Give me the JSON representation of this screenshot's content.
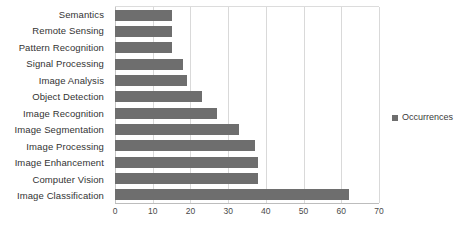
{
  "chart_data": {
    "type": "bar",
    "orientation": "horizontal",
    "title": "",
    "xlabel": "",
    "ylabel": "",
    "xlim": [
      0,
      70
    ],
    "xticks": [
      0,
      10,
      20,
      30,
      40,
      50,
      60,
      70
    ],
    "grid": true,
    "legend_position": "right",
    "categories": [
      "Semantics",
      "Remote Sensing",
      "Pattern Recognition",
      "Signal Processing",
      "Image Analysis",
      "Object Detection",
      "Image Recognition",
      "Image Segmentation",
      "Image Processing",
      "Image Enhancement",
      "Computer Vision",
      "Image Classification"
    ],
    "series": [
      {
        "name": "Occurrences",
        "color": "#6e6e6e",
        "values": [
          15,
          15,
          15,
          18,
          19,
          23,
          27,
          33,
          37,
          38,
          38,
          62
        ]
      }
    ]
  },
  "legend": {
    "entries": [
      {
        "label": "Occurrences",
        "marker": "square-marker",
        "color": "#6e6e6e"
      }
    ]
  },
  "axis": {
    "value_tick_labels": [
      "0",
      "10",
      "20",
      "30",
      "40",
      "50",
      "60",
      "70"
    ]
  },
  "colors": {
    "bar": "#6e6e6e",
    "gridline": "#d9d9d9",
    "text": "#333333",
    "background": "#ffffff"
  }
}
